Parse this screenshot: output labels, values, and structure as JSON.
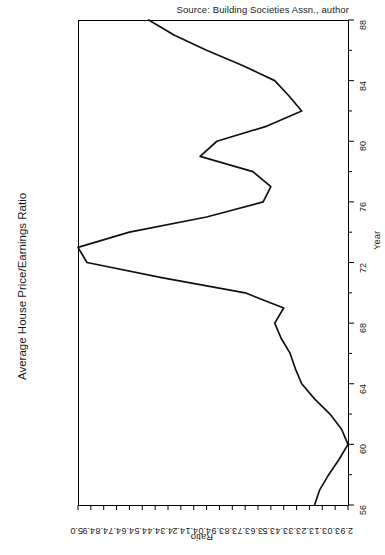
{
  "source_note": "Source: Building Societies Assn., author",
  "main_axis_title": "Average House Price/Earnings Ratio",
  "chart_data": {
    "type": "line",
    "title": "Average House Price/Earnings Ratio",
    "subtitle": "",
    "orientation": "rotated-90",
    "xlabel": "Year",
    "ylabel": "Ratio",
    "xlim": [
      56,
      88
    ],
    "ylim": [
      2.9,
      5.0
    ],
    "grid": false,
    "legend": null,
    "annotations": [
      "Source: Building Societies Assn., author"
    ],
    "x_tick_labels": [
      "56",
      "60",
      "64",
      "68",
      "72",
      "76",
      "80",
      "84",
      "88"
    ],
    "x_major_ticks": [
      56,
      60,
      64,
      68,
      72,
      76,
      80,
      84,
      88
    ],
    "x_minor_ticks": [
      58,
      62,
      66,
      70,
      74,
      78,
      82,
      86
    ],
    "y_tick_labels": [
      "5.0",
      "4.9",
      "4.8",
      "4.7",
      "4.6",
      "4.5",
      "4.4",
      "4.3",
      "4.2",
      "4.1",
      "4.0",
      "3.9",
      "3.8",
      "3.7",
      "3.6",
      "3.5",
      "3.4",
      "3.3",
      "3.2",
      "3.1",
      "3.0",
      "2.9"
    ],
    "y_ticks": [
      5.0,
      4.9,
      4.8,
      4.7,
      4.6,
      4.5,
      4.4,
      4.3,
      4.2,
      4.1,
      4.0,
      3.9,
      3.8,
      3.7,
      3.6,
      3.5,
      3.4,
      3.3,
      3.2,
      3.1,
      3.0,
      2.9
    ],
    "y_axis_inverted": true,
    "series": [
      {
        "name": "Average House Price/Earnings Ratio",
        "color": "#111111",
        "x": [
          56,
          57,
          58,
          59,
          60,
          61,
          62,
          63,
          64,
          65,
          66,
          67,
          68,
          69,
          70,
          71,
          72,
          73,
          74,
          75,
          76,
          77,
          78,
          79,
          80,
          81,
          82,
          83,
          84,
          85,
          86,
          87,
          88
        ],
        "y": [
          3.16,
          3.12,
          3.05,
          2.97,
          2.9,
          2.95,
          3.04,
          3.16,
          3.26,
          3.31,
          3.35,
          3.42,
          3.47,
          3.4,
          3.7,
          4.35,
          4.93,
          5.0,
          4.6,
          4.0,
          3.56,
          3.5,
          3.64,
          4.05,
          3.92,
          3.53,
          3.26,
          3.36,
          3.47,
          3.72,
          4.0,
          4.25,
          4.45
        ]
      }
    ]
  }
}
